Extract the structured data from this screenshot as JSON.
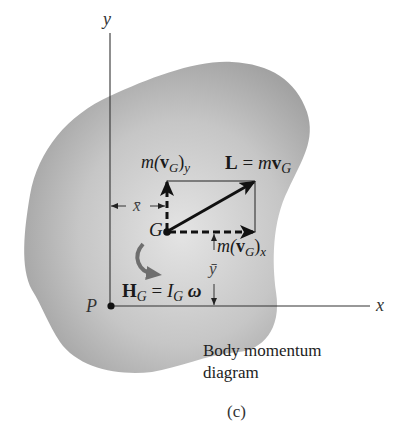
{
  "figure": {
    "panel_label": "(c)",
    "caption_line1": "Body momentum",
    "caption_line2": "diagram"
  },
  "axes": {
    "x_label": "x",
    "y_label": "y",
    "origin_label": "P"
  },
  "points": {
    "center_of_mass_label": "G"
  },
  "vectors": {
    "linear_momentum": {
      "lhs": "L",
      "eq": " = ",
      "m": "m",
      "v": "v",
      "sub": "G"
    },
    "y_component": {
      "m": "m(",
      "v": "v",
      "sub": "G",
      "close": ")",
      "axis_sub": "y"
    },
    "x_component": {
      "m": "m(",
      "v": "v",
      "sub": "G",
      "close": ")",
      "axis_sub": "x"
    },
    "angular_momentum": {
      "lhs": "H",
      "lhs_sub": "G",
      "eq": " = ",
      "I": "I",
      "I_sub": "G",
      "omega": " ω"
    }
  },
  "dimensions": {
    "x_bar": "x̄",
    "y_bar": "ȳ"
  },
  "colors": {
    "body_fill": "#b4b4b4",
    "body_highlight": "#e2e2e2",
    "ink": "#111111",
    "rotation_arrow": "#6e6e6e",
    "background": "#ffffff"
  }
}
